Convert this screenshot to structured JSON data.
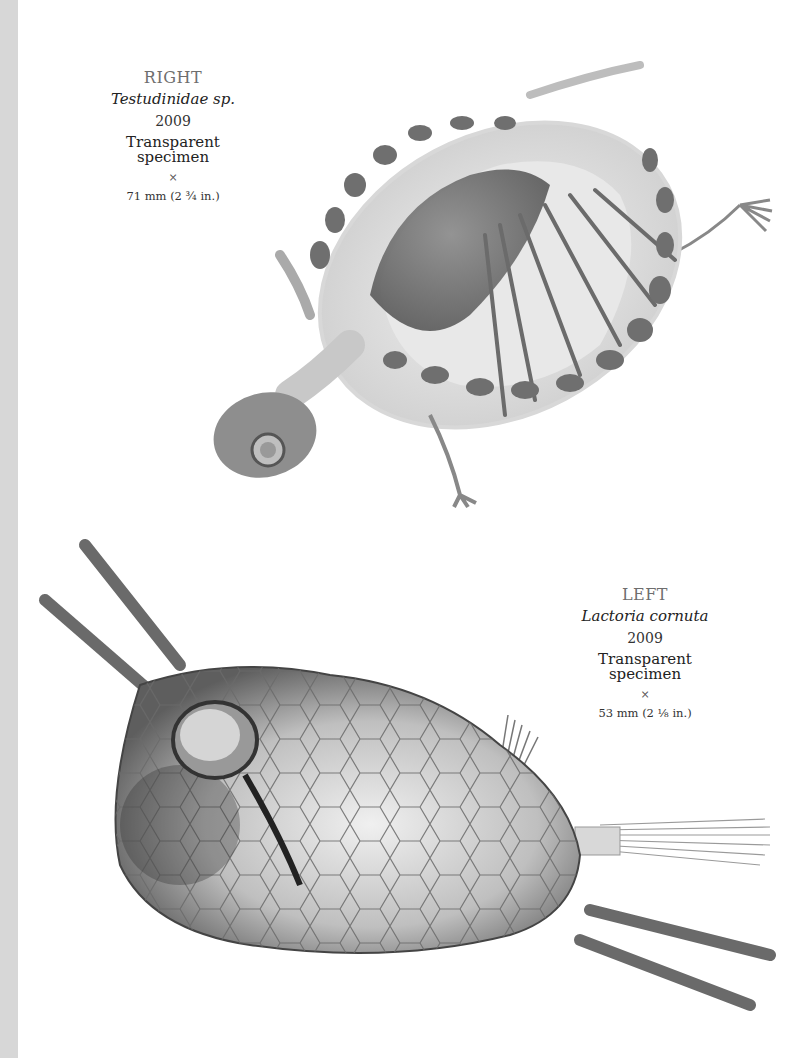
{
  "page": {
    "background": "#ffffff",
    "edge_strip_color": "#d7d7d7"
  },
  "right_entry": {
    "side": "RIGHT",
    "species": "Testudinidae sp.",
    "year": "2009",
    "medium": "Transparent specimen",
    "times": "×",
    "dimensions": "71 mm (2 ¾ in.)",
    "image": "turtle-specimen-image"
  },
  "left_entry": {
    "side": "LEFT",
    "species": "Lactoria cornuta",
    "year": "2009",
    "medium": "Transparent specimen",
    "times": "×",
    "dimensions": "53 mm (2 ⅛ in.)",
    "image": "cowfish-specimen-image"
  }
}
